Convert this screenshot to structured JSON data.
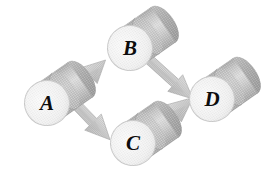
{
  "figure": {
    "kind": "flow-diagram",
    "title": "",
    "background_color": "#ffffff",
    "width": 277,
    "height": 182
  },
  "style": {
    "node_shape": "cylinder",
    "node_face_color": "#f2f2f2",
    "node_face_edge_color": "#cfcfcf",
    "node_body_light": "#e2e2e2",
    "node_body_mid": "#c9c9c9",
    "node_body_dark": "#adadad",
    "node_cap_color": "#b8b8b8",
    "arrow_fill": "#c6c6c6",
    "arrow_shadow": "#b0b0b0",
    "arrow_edge": "#a8a8a8",
    "label_color": "#0d0d0d",
    "tilt_degrees": -35
  },
  "nodes": [
    {
      "id": "A",
      "label": "A",
      "cx": 47,
      "cy": 103,
      "axis_deg": -35
    },
    {
      "id": "B",
      "label": "B",
      "cx": 130,
      "cy": 48,
      "axis_deg": -35
    },
    {
      "id": "C",
      "label": "C",
      "cx": 133,
      "cy": 143,
      "axis_deg": -35
    },
    {
      "id": "D",
      "label": "D",
      "cx": 212,
      "cy": 99,
      "axis_deg": -35
    }
  ],
  "edges": [
    {
      "id": "a-to-b",
      "from": "A",
      "to": "B",
      "direction": "up-right",
      "label": ""
    },
    {
      "id": "a-to-c",
      "from": "A",
      "to": "C",
      "direction": "down-right",
      "label": ""
    },
    {
      "id": "b-to-d",
      "from": "B",
      "to": "D",
      "direction": "down-right",
      "label": ""
    },
    {
      "id": "c-to-d",
      "from": "C",
      "to": "D",
      "direction": "up-right",
      "label": ""
    }
  ]
}
